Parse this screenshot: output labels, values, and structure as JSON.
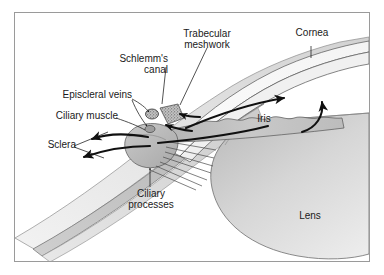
{
  "figure": {
    "type": "anatomical-diagram",
    "border_color": "#9a9a9a",
    "background_color": "#ffffff",
    "ink_color": "#1a1a1a",
    "labels": {
      "cornea": "Cornea",
      "trabecular_meshwork_line1": "Trabecular",
      "trabecular_meshwork_line2": "meshwork",
      "schlemms_canal_line1": "Schlemm's",
      "schlemms_canal_line2": "canal",
      "episcleral_veins": "Episcleral veins",
      "ciliary_muscle": "Ciliary muscle",
      "sclera": "Sclera",
      "iris": "Iris",
      "ciliary_processes_line1": "Ciliary",
      "ciliary_processes_line2": "processes",
      "lens": "Lens"
    },
    "structures": [
      {
        "name": "cornea",
        "fill": "#ffffff",
        "stroke": "#555555"
      },
      {
        "name": "sclera",
        "fill": "#d5d5d5",
        "stroke": "#6b6b6b"
      },
      {
        "name": "trabecular-meshwork",
        "fill": "#b0b0b0",
        "stroke": "#4a4a4a"
      },
      {
        "name": "schlemms-canal",
        "fill": "#8c8c8c",
        "stroke": "#3c3c3c"
      },
      {
        "name": "ciliary-muscle",
        "fill": "#bdbdbd",
        "stroke": "#5a5a5a"
      },
      {
        "name": "ciliary-processes",
        "fill": "#ffffff",
        "stroke": "#4a4a4a"
      },
      {
        "name": "iris",
        "fill": "#c6c6c6",
        "stroke": "#555555"
      },
      {
        "name": "lens",
        "fill": "#d0d0d0",
        "stroke": "#6b6b6b"
      }
    ],
    "flow_arrows": [
      {
        "name": "aqueous-outflow-sclera-upper",
        "direction": "left"
      },
      {
        "name": "aqueous-outflow-sclera-lower",
        "direction": "left"
      },
      {
        "name": "aqueous-inflow-anterior-chamber",
        "direction": "up-right"
      },
      {
        "name": "aqueous-to-trabecular-left",
        "direction": "right"
      },
      {
        "name": "aqueous-to-trabecular-right",
        "direction": "left"
      },
      {
        "name": "aqueous-to-angle",
        "direction": "down-left"
      }
    ]
  }
}
